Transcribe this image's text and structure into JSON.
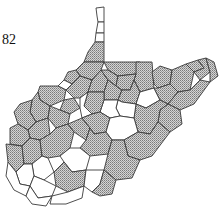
{
  "map": {
    "region": "West Virginia counties",
    "label": "82",
    "legend": {
      "shaded": "stippled gray pattern",
      "unshaded": "white"
    },
    "colors": {
      "border": "#3a3a3a",
      "stipple_dot": "#555555",
      "background": "#ffffff"
    },
    "counties": [
      {
        "id": "hancock",
        "shaded": false,
        "points": "96,8 104,7 104,22 98,22 97,16"
      },
      {
        "id": "brooke",
        "shaded": false,
        "points": "98,22 104,22 104,33 96,33"
      },
      {
        "id": "ohio",
        "shaded": false,
        "points": "96,33 104,33 104,42 95,42"
      },
      {
        "id": "marshall",
        "shaded": true,
        "points": "95,42 104,42 104,62 84,62 88,52"
      },
      {
        "id": "wetzel",
        "shaded": true,
        "points": "84,62 104,62 101,70 92,80 80,76 76,70"
      },
      {
        "id": "tyler",
        "shaded": true,
        "points": "76,70 80,76 72,84 64,80 68,72"
      },
      {
        "id": "pleasants",
        "shaded": false,
        "points": "64,80 72,84 66,90 58,86"
      },
      {
        "id": "wood",
        "shaded": true,
        "points": "40,86 58,86 66,90 64,100 50,106 40,100 38,92"
      },
      {
        "id": "wirt",
        "shaded": true,
        "points": "64,100 74,98 80,108 70,114 60,110"
      },
      {
        "id": "ritchie",
        "shaded": true,
        "points": "66,90 72,84 80,76 92,80 88,92 80,98 74,98"
      },
      {
        "id": "doddridge",
        "shaded": true,
        "points": "92,80 101,70 108,80 104,92 88,92"
      },
      {
        "id": "monongalia",
        "shaded": true,
        "points": "104,62 140,62 136,74 118,76 108,70"
      },
      {
        "id": "preston",
        "shaded": true,
        "points": "136,62 152,62 154,88 140,92 134,80 136,74"
      },
      {
        "id": "marion",
        "shaded": true,
        "points": "101,70 108,70 118,76 116,86 108,80"
      },
      {
        "id": "harrison",
        "shaded": true,
        "points": "104,92 108,80 116,86 122,90 118,100 104,100"
      },
      {
        "id": "taylor",
        "shaded": true,
        "points": "118,76 136,74 134,80 130,90 122,90 116,86"
      },
      {
        "id": "barbour",
        "shaded": true,
        "points": "122,90 130,90 134,80 140,92 136,104 122,102 118,100"
      },
      {
        "id": "tucker",
        "shaded": false,
        "points": "140,92 154,88 160,100 146,108 136,104"
      },
      {
        "id": "mineral",
        "shaded": true,
        "points": "152,72 160,66 172,70 170,84 158,88 154,84"
      },
      {
        "id": "grant",
        "shaded": true,
        "points": "154,88 158,88 170,84 178,92 168,104 160,100"
      },
      {
        "id": "hampshire",
        "shaded": true,
        "points": "172,70 186,64 194,72 190,90 178,92 170,84"
      },
      {
        "id": "morgan",
        "shaded": true,
        "points": "186,64 198,60 204,68 194,72"
      },
      {
        "id": "berkeley",
        "shaded": true,
        "points": "198,60 206,58 210,72 200,80 194,72 204,68"
      },
      {
        "id": "jefferson",
        "shaded": true,
        "points": "206,58 214,62 218,76 210,82 210,72"
      },
      {
        "id": "hardy",
        "shaded": true,
        "points": "178,92 190,90 200,80 210,82 194,104 180,110 168,104"
      },
      {
        "id": "pendleton",
        "shaded": true,
        "points": "168,104 180,110 182,124 170,132 158,122 160,110"
      },
      {
        "id": "randolph",
        "shaded": true,
        "points": "136,104 146,108 160,100 168,104 160,110 158,122 150,134 138,132 134,118"
      },
      {
        "id": "upshur",
        "shaded": false,
        "points": "118,100 122,102 136,104 134,118 120,116 116,108"
      },
      {
        "id": "lewis",
        "shaded": false,
        "points": "104,100 118,100 116,108 120,116 110,118 100,112"
      },
      {
        "id": "gilmer",
        "shaded": true,
        "points": "88,92 104,92 104,100 100,112 92,114 84,106"
      },
      {
        "id": "calhoun",
        "shaded": false,
        "points": "80,98 88,92 84,106 92,114 82,118 80,108"
      },
      {
        "id": "jackson",
        "shaded": true,
        "points": "38,92 40,100 50,106 48,118 36,122 30,112 32,100"
      },
      {
        "id": "roane",
        "shaded": true,
        "points": "50,106 60,110 70,114 68,124 56,128 48,118"
      },
      {
        "id": "mason",
        "shaded": true,
        "points": "20,104 32,100 30,112 36,122 28,130 18,124 14,112"
      },
      {
        "id": "putnam",
        "shaded": true,
        "points": "28,130 36,122 48,118 50,134 40,140 30,138"
      },
      {
        "id": "cabell",
        "shaded": true,
        "points": "10,128 18,124 28,130 30,138 22,146 10,144"
      },
      {
        "id": "wayne",
        "shaded": true,
        "points": "6,144 22,146 24,164 16,172 8,162"
      },
      {
        "id": "lincoln",
        "shaded": true,
        "points": "22,146 30,138 40,140 42,156 32,164 24,164"
      },
      {
        "id": "kanawha",
        "shaded": true,
        "points": "40,140 50,134 56,128 68,124 74,132 70,148 60,156 48,158 42,156"
      },
      {
        "id": "clay",
        "shaded": true,
        "points": "68,124 82,118 90,128 86,140 74,132"
      },
      {
        "id": "braxton",
        "shaded": true,
        "points": "82,118 92,114 100,112 110,118 106,132 94,134 90,128"
      },
      {
        "id": "webster",
        "shaded": false,
        "points": "106,132 110,118 120,116 134,118 138,132 124,140 112,140"
      },
      {
        "id": "nicholas",
        "shaded": true,
        "points": "86,140 90,128 94,134 106,132 112,140 108,154 90,156 80,148"
      },
      {
        "id": "pocahontas",
        "shaded": true,
        "points": "124,140 138,132 150,134 158,122 170,132 152,156 140,160 128,156"
      },
      {
        "id": "fayette",
        "shaded": false,
        "points": "70,148 80,148 90,156 86,170 72,172 64,162 60,156"
      },
      {
        "id": "greenbrier",
        "shaded": true,
        "points": "108,154 112,140 124,140 128,156 140,160 132,178 116,180 104,170"
      },
      {
        "id": "boone",
        "shaded": false,
        "points": "32,164 42,156 48,158 54,172 44,180 34,176"
      },
      {
        "id": "logan",
        "shaded": false,
        "points": "16,172 24,164 32,164 34,176 30,186 20,184"
      },
      {
        "id": "mingo",
        "shaded": false,
        "points": "8,162 16,172 20,184 30,186 26,196 14,190 6,176"
      },
      {
        "id": "raleigh",
        "shaded": true,
        "points": "54,172 64,162 72,172 86,170 84,186 68,192 56,186"
      },
      {
        "id": "wyoming",
        "shaded": false,
        "points": "34,176 44,180 56,186 52,196 38,198 30,186"
      },
      {
        "id": "mcdowell",
        "shaded": false,
        "points": "26,196 30,186 38,198 52,196 46,206 32,204"
      },
      {
        "id": "mercer",
        "shaded": false,
        "points": "52,196 68,192 84,186 82,198 66,204 50,204"
      },
      {
        "id": "summers",
        "shaded": false,
        "points": "84,186 86,170 104,170 100,184 92,192"
      },
      {
        "id": "monroe",
        "shaded": true,
        "points": "100,184 104,170 116,180 112,194 100,196 92,192"
      }
    ]
  }
}
